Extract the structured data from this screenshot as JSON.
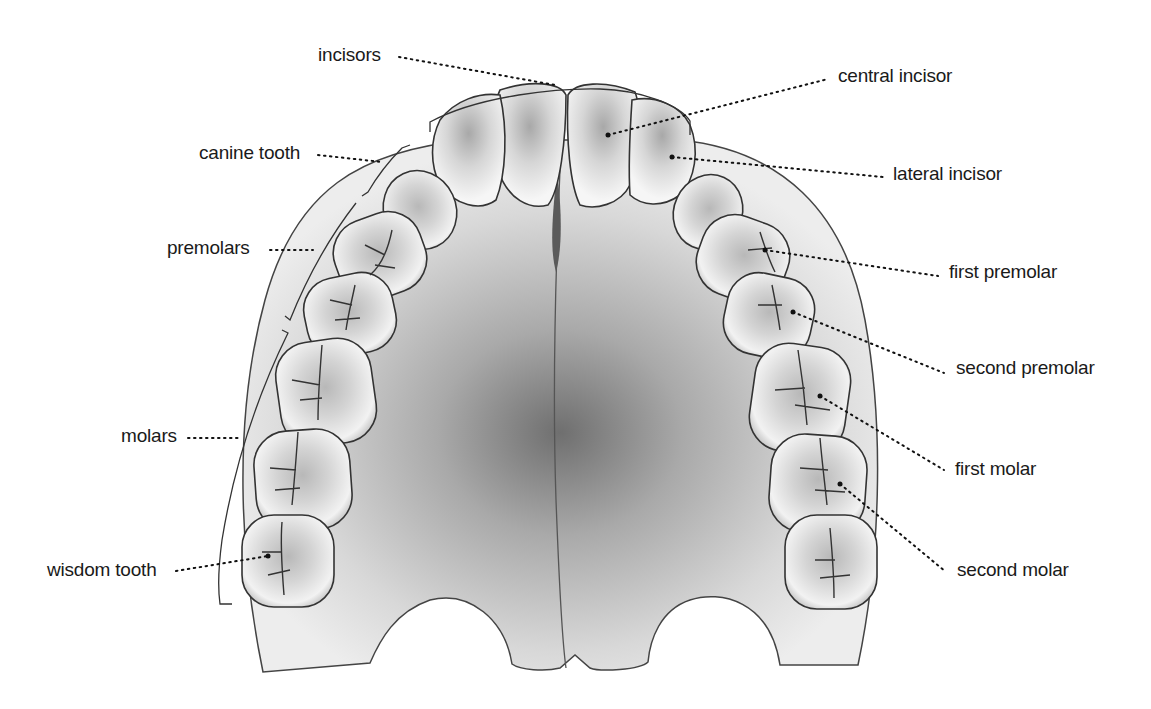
{
  "diagram": {
    "colors": {
      "background": "#ffffff",
      "palate_light": "#e4e4e4",
      "palate_dark": "#7a7a7a",
      "tooth_fill": "#ececec",
      "tooth_shade": "#9a9a9a",
      "outline": "#333333",
      "leader_dots": "#111111",
      "label_text": "#1a1a1a"
    },
    "group_labels": {
      "incisors": "incisors",
      "canine": "canine tooth",
      "premolars": "premolars",
      "molars": "molars",
      "wisdom": "wisdom tooth"
    },
    "tooth_labels": {
      "central_incisor": "central incisor",
      "lateral_incisor": "lateral incisor",
      "first_premolar": "first premolar",
      "second_premolar": "second premolar",
      "first_molar": "first molar",
      "second_molar": "second molar"
    }
  }
}
